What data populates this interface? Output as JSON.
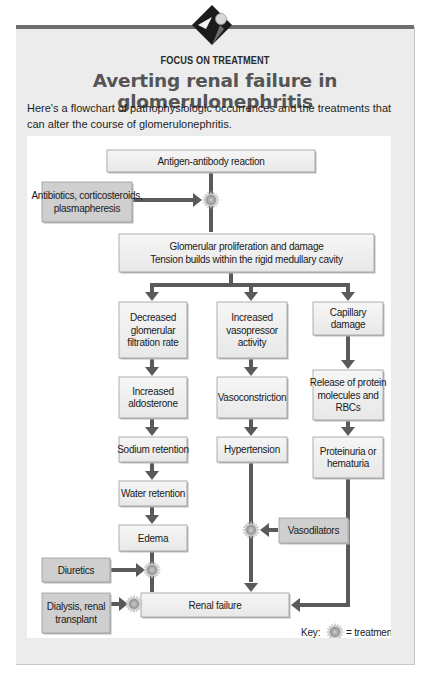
{
  "header": {
    "kicker": "FOCUS ON TREATMENT",
    "title": "Averting renal failure in glomerulonephritis",
    "intro": "Here's a flowchart of pathophysiologic occurrences and the treatments that can alter the course of glomerulonephritis.",
    "logo_icon": "diamond-sphere-logo-icon"
  },
  "colors": {
    "process_box": "#f1f1f1",
    "treatment_box": "#cfcfcf",
    "arrow": "#5a5a5a",
    "treatment_marker": "#a8a8a8",
    "title": "#555555"
  },
  "flowchart": {
    "top": {
      "antigen": "Antigen-antibody reaction",
      "antibiotics": [
        "Antibiotics, corticosteroids,",
        "plasmapheresis"
      ],
      "glomerular": [
        "Glomerular proliferation and damage",
        "Tension builds within the rigid medullary cavity"
      ]
    },
    "left_column": {
      "gfr": [
        "Decreased",
        "glomerular",
        "filtration rate"
      ],
      "aldosterone": [
        "Increased",
        "aldosterone"
      ],
      "sodium": "Sodium retention",
      "water": "Water retention",
      "edema": "Edema"
    },
    "middle_column": {
      "vasopressor": [
        "Increased",
        "vasopressor",
        "activity"
      ],
      "vasoconstriction": "Vasoconstriction",
      "hypertension": "Hypertension"
    },
    "right_column": {
      "capillary": [
        "Capillary",
        "damage"
      ],
      "release": [
        "Release of protein",
        "molecules and",
        "RBCs"
      ],
      "proteinuria": [
        "Proteinuria or",
        "hematuria"
      ]
    },
    "treatments": {
      "vasodilators": "Vasodilators",
      "diuretics": "Diuretics",
      "dialysis": [
        "Dialysis, renal",
        "transplant"
      ]
    },
    "outcome": "Renal failure",
    "key": {
      "label": "Key:",
      "meaning": "= treatment",
      "icon": "treatment-starburst-icon"
    }
  }
}
